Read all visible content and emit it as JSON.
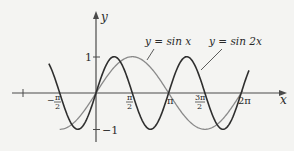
{
  "chart_data": {
    "type": "line",
    "title": "",
    "xlabel": "x",
    "ylabel": "y",
    "xlim": [
      -3.14159,
      6.5
    ],
    "ylim": [
      -1.4,
      2.2
    ],
    "grid": false,
    "legend": "inline annotations with leader lines",
    "x_ticks": [
      {
        "value": -3.14159,
        "label": ""
      },
      {
        "value": -1.5708,
        "label": "-π/2"
      },
      {
        "value": 1.5708,
        "label": "π/2"
      },
      {
        "value": 3.14159,
        "label": "π"
      },
      {
        "value": 4.71239,
        "label": "3π/2"
      },
      {
        "value": 6.28319,
        "label": "2π"
      }
    ],
    "y_ticks": [
      {
        "value": 1,
        "label": "1"
      },
      {
        "value": -1,
        "label": "−1"
      }
    ],
    "series": [
      {
        "name": "y = sin x",
        "function": "sin(x)",
        "domain": [
          -1.5708,
          6.35
        ],
        "color": "#8a8a8a",
        "key_points": [
          [
            -1.5708,
            -1
          ],
          [
            0,
            0
          ],
          [
            1.5708,
            1
          ],
          [
            3.14159,
            0
          ],
          [
            4.71239,
            -1
          ],
          [
            6.28319,
            0
          ]
        ]
      },
      {
        "name": "y = sin 2x",
        "function": "sin(2x)",
        "domain": [
          -2.04,
          6.62
        ],
        "color": "#2e2e2e",
        "key_points": [
          [
            -2.356,
            1
          ],
          [
            -1.5708,
            0
          ],
          [
            -0.7854,
            -1
          ],
          [
            0,
            0
          ],
          [
            0.7854,
            1
          ],
          [
            1.5708,
            0
          ],
          [
            2.356,
            -1
          ],
          [
            3.14159,
            0
          ],
          [
            3.927,
            1
          ],
          [
            4.71239,
            0
          ],
          [
            5.498,
            -1
          ],
          [
            6.28319,
            0
          ]
        ]
      }
    ],
    "annotations": [
      {
        "text": "y = sin x",
        "points_to": "sin x curve"
      },
      {
        "text": "y = sin 2x",
        "points_to": "sin 2x curve"
      }
    ]
  },
  "labels": {
    "x_axis": "x",
    "y_axis": "y",
    "y_tick_pos": "1",
    "y_tick_neg": "−1",
    "tick_neg_half_pi_num": "π",
    "tick_neg_half_pi_den": "2",
    "tick_neg_half_pi_sign": "−",
    "tick_half_pi_num": "π",
    "tick_half_pi_den": "2",
    "tick_pi": "π",
    "tick_three_half_pi_num": "3π",
    "tick_three_half_pi_den": "2",
    "tick_two_pi": "2π",
    "annotation_sinx": "y = sin x",
    "annotation_sin2x": "y = sin 2x"
  },
  "colors": {
    "axis": "#4a4a4a",
    "sin_x": "#8a8a8a",
    "sin_2x": "#2e2e2e",
    "text": "#2a2a2a",
    "background": "#f4f4f2"
  }
}
